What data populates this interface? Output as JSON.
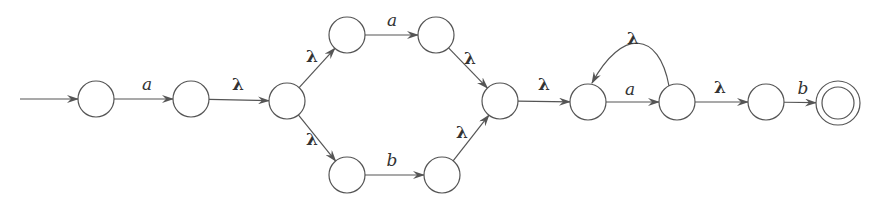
{
  "diagram": {
    "type": "nfa",
    "title": "",
    "states": [
      {
        "id": "q0",
        "accepting": false,
        "initial": true
      },
      {
        "id": "q1",
        "accepting": false
      },
      {
        "id": "q2",
        "accepting": false
      },
      {
        "id": "q3",
        "accepting": false
      },
      {
        "id": "q4",
        "accepting": false
      },
      {
        "id": "q5",
        "accepting": false
      },
      {
        "id": "q6",
        "accepting": false
      },
      {
        "id": "q7",
        "accepting": false
      },
      {
        "id": "q8",
        "accepting": false
      },
      {
        "id": "q9",
        "accepting": false
      },
      {
        "id": "q10",
        "accepting": false
      },
      {
        "id": "q11",
        "accepting": true
      }
    ],
    "transitions": [
      {
        "from": "q0",
        "to": "q1",
        "label": "a"
      },
      {
        "from": "q1",
        "to": "q2",
        "label": "λ"
      },
      {
        "from": "q2",
        "to": "q3",
        "label": "λ"
      },
      {
        "from": "q2",
        "to": "q5",
        "label": "λ"
      },
      {
        "from": "q3",
        "to": "q4",
        "label": "a"
      },
      {
        "from": "q5",
        "to": "q6",
        "label": "b"
      },
      {
        "from": "q4",
        "to": "q7",
        "label": "λ"
      },
      {
        "from": "q6",
        "to": "q7",
        "label": "λ"
      },
      {
        "from": "q7",
        "to": "q8",
        "label": "λ"
      },
      {
        "from": "q8",
        "to": "q9",
        "label": "a"
      },
      {
        "from": "q9",
        "to": "q8",
        "label": "λ"
      },
      {
        "from": "q9",
        "to": "q10",
        "label": "λ"
      },
      {
        "from": "q10",
        "to": "q11",
        "label": "b"
      }
    ],
    "colors": {
      "stroke": "#555555",
      "text": "#333333",
      "background": "#ffffff"
    }
  }
}
